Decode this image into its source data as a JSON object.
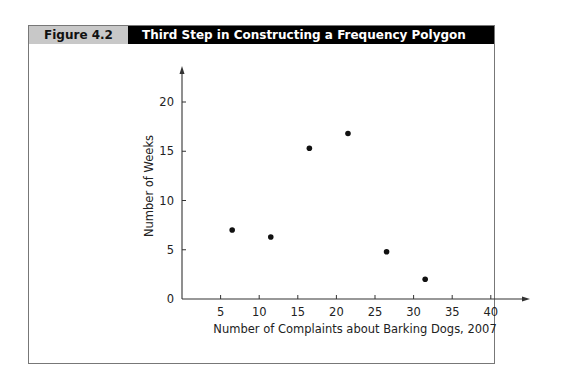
{
  "figure": {
    "label": "Figure 4.2",
    "title": "Third Step in Constructing a Frequency Polygon"
  },
  "chart_data": {
    "type": "scatter",
    "title": "Third Step in Constructing a Frequency Polygon",
    "xlabel": "Number of Complaints about Barking Dogs, 2007",
    "ylabel": "Number of Weeks",
    "x_ticks": [
      5,
      10,
      15,
      20,
      25,
      30,
      35,
      40
    ],
    "y_ticks": [
      0,
      5,
      10,
      15,
      20
    ],
    "xlim": [
      0,
      45
    ],
    "ylim": [
      0,
      23
    ],
    "grid": false,
    "points": [
      {
        "x": 6.5,
        "y": 7
      },
      {
        "x": 11.5,
        "y": 6.3
      },
      {
        "x": 16.5,
        "y": 15.3
      },
      {
        "x": 21.5,
        "y": 16.8
      },
      {
        "x": 26.5,
        "y": 4.8
      },
      {
        "x": 31.5,
        "y": 2
      }
    ]
  }
}
